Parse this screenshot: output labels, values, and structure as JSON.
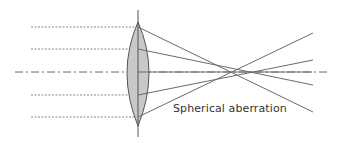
{
  "diagram": {
    "caption": "Spherical aberration",
    "colors": {
      "line": "#6b6b6b",
      "lens_fill": "#c8c8c8",
      "lens_stroke": "#555555",
      "text": "#333333"
    },
    "elements": {
      "optical_axis": "dash-dot horizontal axis",
      "lens": "biconvex converging lens",
      "incident_rays": 4,
      "refracted_rays": 4
    }
  }
}
